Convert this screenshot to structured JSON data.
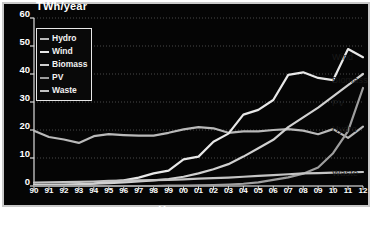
{
  "chart_data": {
    "type": "line",
    "title": "",
    "xlabel": "Year",
    "ylabel": "TWh/year",
    "ylim": [
      0,
      60
    ],
    "yticks": [
      0,
      10,
      20,
      30,
      40,
      50,
      60
    ],
    "grid": true,
    "legend_position": "upper-left-inside",
    "x": [
      "90",
      "91",
      "92",
      "93",
      "94",
      "95",
      "96",
      "97",
      "98",
      "99",
      "00",
      "01",
      "02",
      "03",
      "04",
      "05",
      "06",
      "07",
      "08",
      "09",
      "10",
      "11",
      "12"
    ],
    "x_full_years": [
      1990,
      1991,
      1992,
      1993,
      1994,
      1995,
      1996,
      1997,
      1998,
      1999,
      2000,
      2001,
      2002,
      2003,
      2004,
      2005,
      2006,
      2007,
      2008,
      2009,
      2010,
      2011,
      2012
    ],
    "series": [
      {
        "name": "Hydro",
        "color": "#b9b9b9",
        "end_label": "Hydro",
        "values": [
          19.7,
          17.5,
          16.6,
          15.4,
          17.8,
          18.5,
          18.2,
          18.0,
          18.0,
          19.0,
          20.2,
          21.0,
          20.6,
          19.0,
          19.5,
          19.5,
          20.0,
          20.3,
          19.8,
          18.5,
          20.3,
          17.2,
          21.2
        ]
      },
      {
        "name": "Wind",
        "color": "#e8e8e8",
        "end_label": "Wind",
        "values": [
          0.1,
          0.2,
          0.3,
          0.6,
          0.9,
          1.5,
          2.0,
          3.0,
          4.5,
          5.5,
          9.5,
          10.5,
          15.8,
          18.7,
          25.5,
          27.2,
          30.7,
          39.7,
          40.6,
          38.6,
          37.8,
          48.9,
          46.0
        ]
      },
      {
        "name": "Biomass",
        "color": "#d0d0d0",
        "end_label": "Biomass",
        "values": [
          0.3,
          0.4,
          0.5,
          0.6,
          0.8,
          1.0,
          1.3,
          1.6,
          2.0,
          2.5,
          3.3,
          4.5,
          6.0,
          7.8,
          10.5,
          13.5,
          16.5,
          21.0,
          24.5,
          28.0,
          32.0,
          36.0,
          40.0
        ]
      },
      {
        "name": "PV",
        "color": "#9e9e9e",
        "end_label": "PV",
        "values": [
          0.0,
          0.0,
          0.0,
          0.0,
          0.0,
          0.0,
          0.0,
          0.0,
          0.0,
          0.1,
          0.1,
          0.2,
          0.3,
          0.5,
          0.8,
          1.3,
          2.2,
          3.1,
          4.4,
          6.6,
          11.7,
          19.6,
          35.0
        ]
      },
      {
        "name": "Waste",
        "color": "#c4c4c4",
        "end_label": "Waste",
        "values": [
          1.2,
          1.3,
          1.4,
          1.5,
          1.6,
          1.8,
          1.9,
          2.0,
          2.1,
          2.2,
          2.4,
          2.6,
          2.8,
          3.0,
          3.3,
          3.6,
          3.9,
          4.2,
          4.5,
          4.6,
          4.8,
          4.9,
          5.0
        ]
      }
    ]
  },
  "legend": {
    "items": [
      {
        "label": "Hydro",
        "color": "#b9b9b9"
      },
      {
        "label": "Wind",
        "color": "#e8e8e8"
      },
      {
        "label": "Biomass",
        "color": "#d0d0d0"
      },
      {
        "label": "PV",
        "color": "#9e9e9e"
      },
      {
        "label": "Waste",
        "color": "#c4c4c4"
      }
    ]
  },
  "side_labels": [
    {
      "label": "Wind",
      "top": 52
    },
    {
      "label": "Biomass",
      "top": 75
    },
    {
      "label": "PV",
      "top": 98
    },
    {
      "label": "Hydro",
      "top": 124
    },
    {
      "label": "Waste",
      "top": 168
    }
  ],
  "theme": {
    "background": "#050505",
    "frame": "#c9c9c9",
    "text": "#ffffff",
    "grid": "#6a6a6a"
  }
}
